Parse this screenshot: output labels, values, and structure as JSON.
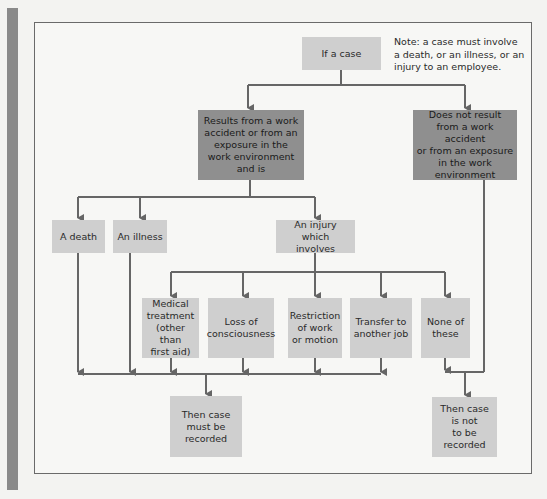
{
  "diagram": {
    "start": "If a case",
    "note": "Note: a case must involve\na death, or an illness, or an\ninjury to an employee.",
    "work_related": "Results from a work\naccident or from an\nexposure in the\nwork environment\nand is",
    "not_work_related": "Does not result\nfrom a work accident\nor from an exposure\nin the work\nenvironment",
    "outcomes": {
      "death": "A death",
      "illness": "An illness",
      "injury": "An injury which\ninvolves"
    },
    "injury_types": [
      "Medical\ntreatment\n(other than\nfirst aid)",
      "Loss of\nconsciousness",
      "Restriction\nof work\nor motion",
      "Transfer to\nanother job",
      "None of\nthese"
    ],
    "result_recorded": "Then case\nmust be\nrecorded",
    "result_not_recorded": "Then case\nis not\nto be\nrecorded"
  },
  "colors": {
    "light_box": "#cfcfcf",
    "dark_box": "#8f8f8f",
    "line": "#666666",
    "side_bar": "#8a8a8a"
  }
}
